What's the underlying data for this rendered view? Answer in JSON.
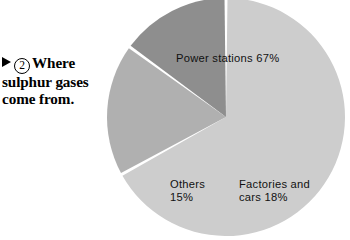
{
  "caption": {
    "marker_icon": "triangle-right-icon",
    "figure_number": "2",
    "line1": "Where",
    "line2": "sulphur gases",
    "line3": "come from."
  },
  "chart_data": {
    "type": "pie",
    "title": "Where sulphur gases come from.",
    "categories": [
      "Power stations",
      "Factories and cars",
      "Others"
    ],
    "values": [
      67,
      18,
      15
    ],
    "unit": "%",
    "labels": [
      "Power stations 67%",
      "Factories and cars 18%",
      "Others 15%"
    ],
    "label_lines": {
      "power": [
        "Power stations 67%"
      ],
      "factories": [
        "Factories and cars",
        "cars 18%"
      ],
      "others": [
        "Others",
        "15%"
      ]
    },
    "slices": [
      {
        "name": "Power stations",
        "value": 67,
        "color": "#cdcdcd",
        "label": "Power stations 67%"
      },
      {
        "name": "Factories and cars",
        "value": 18,
        "color": "#b0b0b0",
        "label_l1": "Factories and",
        "label_l2": "cars 18%"
      },
      {
        "name": "Others",
        "value": 15,
        "color": "#8e8e8e",
        "label_l1": "Others",
        "label_l2": "15%"
      }
    ],
    "legend": "none",
    "grid": false,
    "start_angle_deg": 0,
    "direction": "clockwise",
    "separator_color": "#ffffff",
    "background": "#ffffff"
  }
}
